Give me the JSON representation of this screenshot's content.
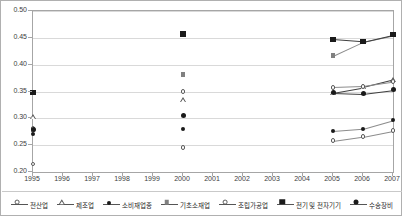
{
  "chart_data": {
    "type": "line",
    "title": "",
    "xlabel": "",
    "ylabel": "",
    "x": [
      1995,
      1996,
      1997,
      1998,
      1999,
      2000,
      2001,
      2002,
      2003,
      2004,
      2005,
      2006,
      2007
    ],
    "xtick_labels": [
      "1995",
      "1996",
      "1997",
      "1998",
      "1999",
      "2000",
      "2001",
      "2002",
      "2003",
      "2004",
      "2005",
      "2006",
      "2007"
    ],
    "ylim": [
      0.2,
      0.5
    ],
    "ytick_labels": [
      "0.20",
      "0.25",
      "0.30",
      "0.35",
      "0.40",
      "0.45",
      "0.50"
    ],
    "yticks": [
      0.2,
      0.25,
      0.3,
      0.35,
      0.4,
      0.45,
      0.5
    ],
    "grid": "horizontal",
    "legend_position": "bottom",
    "series": [
      {
        "name": "전산업",
        "marker": "open-circle",
        "points": [
          {
            "x": 1995,
            "y": 0.215
          },
          {
            "x": 2000,
            "y": 0.246
          },
          {
            "x": 2005,
            "y": 0.258
          },
          {
            "x": 2006,
            "y": 0.266
          },
          {
            "x": 2007,
            "y": 0.277
          }
        ]
      },
      {
        "name": "제조업",
        "marker": "open-triangle",
        "points": [
          {
            "x": 1995,
            "y": 0.302
          },
          {
            "x": 2000,
            "y": 0.335
          },
          {
            "x": 2005,
            "y": 0.348
          },
          {
            "x": 2006,
            "y": 0.358
          },
          {
            "x": 2007,
            "y": 0.372
          }
        ]
      },
      {
        "name": "소비재업종",
        "marker": "filled-circle-small",
        "points": [
          {
            "x": 1995,
            "y": 0.27
          },
          {
            "x": 2000,
            "y": 0.281
          },
          {
            "x": 2005,
            "y": 0.276
          },
          {
            "x": 2006,
            "y": 0.28
          },
          {
            "x": 2007,
            "y": 0.296
          }
        ]
      },
      {
        "name": "기초소재업",
        "marker": "filled-square-gray",
        "points": [
          {
            "x": 1995,
            "y": 0.278
          },
          {
            "x": 2000,
            "y": 0.382
          },
          {
            "x": 2005,
            "y": 0.417
          },
          {
            "x": 2006,
            "y": 0.443
          },
          {
            "x": 2007,
            "y": 0.455
          }
        ]
      },
      {
        "name": "조립가공업",
        "marker": "open-circle",
        "points": [
          {
            "x": 1995,
            "y": 0.281
          },
          {
            "x": 2000,
            "y": 0.35
          },
          {
            "x": 2005,
            "y": 0.358
          },
          {
            "x": 2006,
            "y": 0.36
          },
          {
            "x": 2007,
            "y": 0.368
          }
        ]
      },
      {
        "name": "전기 및 전자기기",
        "marker": "filled-square",
        "points": [
          {
            "x": 1995,
            "y": 0.348
          },
          {
            "x": 2000,
            "y": 0.457
          },
          {
            "x": 2005,
            "y": 0.447
          },
          {
            "x": 2006,
            "y": 0.443
          },
          {
            "x": 2007,
            "y": 0.456
          }
        ]
      },
      {
        "name": "수송장비",
        "marker": "filled-circle",
        "points": [
          {
            "x": 1995,
            "y": 0.279
          },
          {
            "x": 2000,
            "y": 0.306
          },
          {
            "x": 2005,
            "y": 0.348
          },
          {
            "x": 2006,
            "y": 0.346
          },
          {
            "x": 2007,
            "y": 0.353
          }
        ]
      }
    ],
    "legend": [
      {
        "label": "전산업",
        "marker": "open-circle"
      },
      {
        "label": "제조업",
        "marker": "open-triangle"
      },
      {
        "label": "소비재업종",
        "marker": "filled-circle-small"
      },
      {
        "label": "기초소재업",
        "marker": "filled-square-gray"
      },
      {
        "label": "조립가공업",
        "marker": "open-circle"
      },
      {
        "label": "전기 및 전자기기",
        "marker": "filled-square"
      },
      {
        "label": "수송장비",
        "marker": "filled-circle"
      }
    ]
  }
}
